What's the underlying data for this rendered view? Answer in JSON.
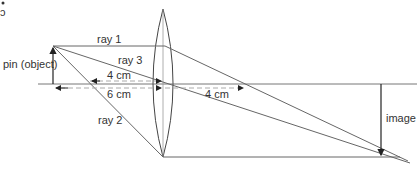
{
  "diagram": {
    "labels": {
      "object": "pin (object)",
      "image": "image",
      "ray1": "ray 1",
      "ray2": "ray 2",
      "ray3": "ray 3",
      "focal_left": "4 cm",
      "object_distance": "6 cm",
      "focal_right": "4 cm"
    },
    "colors": {
      "line": "#555555",
      "text": "#333333",
      "dashed": "#999999",
      "background": "#ffffff"
    }
  }
}
